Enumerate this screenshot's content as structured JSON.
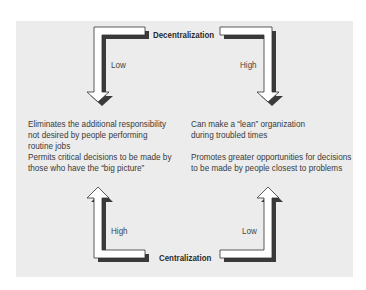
{
  "diagram": {
    "top_axis": {
      "label": "Decentralization",
      "left_arrow_level": "Low",
      "right_arrow_level": "High"
    },
    "bottom_axis": {
      "label": "Centralization",
      "left_arrow_level": "High",
      "right_arrow_level": "Low"
    },
    "left_column": {
      "upper": [
        "Eliminates the additional responsibility",
        "not desired by people performing",
        "routine jobs"
      ],
      "lower": [
        "Permits critical decisions to be made by",
        "those who have the “big picture”"
      ]
    },
    "right_column": {
      "upper": [
        "Can make a “lean” organization",
        "during troubled times"
      ],
      "lower": [
        "Promotes greater opportunities for decisions",
        "to be made by people closest to problems"
      ]
    },
    "colors": {
      "panel": "#ececec",
      "arrow_fill": "#ffffff",
      "arrow_outline": "#333333",
      "arrow_shadow": "#3a3a3a"
    }
  }
}
